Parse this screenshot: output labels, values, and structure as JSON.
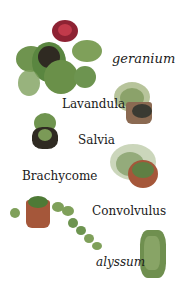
{
  "labels": {
    "geranium": "geranium",
    "lavandula": "Lavandula",
    "salvia": "Salvia",
    "brachycome": "Brachycome",
    "convolvulus": "Convolvulus",
    "alyssum": "alyssum"
  },
  "colors": {
    "background": "#ffffff",
    "text": "#1a1a1a",
    "foliage_dark": "#3f6b2c",
    "foliage_light": "#7fa05a",
    "flower_red": "#b0283a",
    "pot_terracotta": "#a5573a",
    "pot_dark": "#2f2a22"
  }
}
